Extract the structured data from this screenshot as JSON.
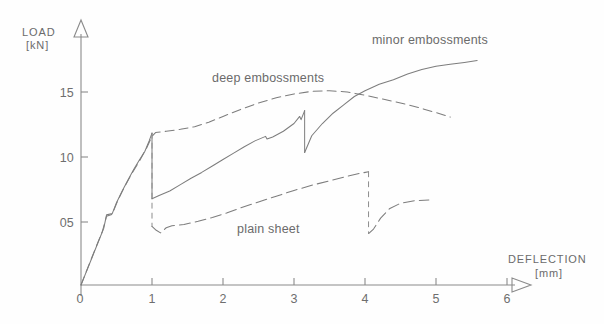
{
  "figure": {
    "background_color": "#fefefe",
    "line_color": "#7d7d7d",
    "axis_color": "#8a8a8a",
    "text_color": "#6b6b6b"
  },
  "axes": {
    "y_title_line1": "LOAD",
    "y_title_line2": "[kN]",
    "x_title_line1": "DEFLECTION",
    "x_title_line2": "[mm]",
    "y_ticks": [
      "15",
      "10",
      "05"
    ],
    "y_origin_label": "0",
    "x_ticks": [
      "1",
      "2",
      "3",
      "4",
      "5",
      "6"
    ]
  },
  "labels": {
    "minor": "minor embossments",
    "deep": "deep embossments",
    "plain": "plain sheet"
  },
  "chart_data": {
    "type": "line",
    "title": "",
    "xlabel": "DEFLECTION [mm]",
    "ylabel": "LOAD [kN]",
    "xlim": [
      0,
      6
    ],
    "ylim": [
      0,
      18.5
    ],
    "xticks": [
      0,
      1,
      2,
      3,
      4,
      5,
      6
    ],
    "yticks": [
      0,
      5,
      10,
      15
    ],
    "ytick_labels": [
      "0",
      "05",
      "10",
      "15"
    ],
    "grid": false,
    "legend_position": "inline-annotations",
    "series": [
      {
        "name": "minor embossments",
        "style": "solid",
        "annotation": "minor embossments",
        "annotation_at": [
          4.7,
          17.9
        ],
        "points": [
          [
            0.0,
            0.0
          ],
          [
            0.08,
            1.1
          ],
          [
            0.16,
            2.2
          ],
          [
            0.24,
            3.3
          ],
          [
            0.32,
            4.4
          ],
          [
            0.36,
            5.45
          ],
          [
            0.44,
            5.55
          ],
          [
            0.5,
            6.4
          ],
          [
            0.58,
            7.3
          ],
          [
            0.66,
            8.15
          ],
          [
            0.74,
            8.95
          ],
          [
            0.82,
            9.7
          ],
          [
            0.9,
            10.4
          ],
          [
            0.96,
            11.2
          ],
          [
            1.0,
            11.8
          ],
          [
            1.0,
            6.7
          ],
          [
            1.1,
            6.95
          ],
          [
            1.25,
            7.3
          ],
          [
            1.4,
            7.8
          ],
          [
            1.55,
            8.3
          ],
          [
            1.7,
            8.75
          ],
          [
            1.85,
            9.25
          ],
          [
            2.0,
            9.75
          ],
          [
            2.15,
            10.25
          ],
          [
            2.3,
            10.75
          ],
          [
            2.45,
            11.2
          ],
          [
            2.6,
            11.55
          ],
          [
            2.62,
            11.35
          ],
          [
            2.7,
            11.5
          ],
          [
            2.85,
            11.95
          ],
          [
            3.0,
            12.55
          ],
          [
            3.08,
            13.1
          ],
          [
            3.1,
            12.85
          ],
          [
            3.15,
            13.55
          ],
          [
            3.15,
            10.3
          ],
          [
            3.25,
            11.6
          ],
          [
            3.4,
            12.55
          ],
          [
            3.55,
            13.35
          ],
          [
            3.7,
            14.0
          ],
          [
            3.85,
            14.65
          ],
          [
            4.0,
            15.1
          ],
          [
            4.2,
            15.6
          ],
          [
            4.4,
            15.95
          ],
          [
            4.6,
            16.4
          ],
          [
            4.8,
            16.75
          ],
          [
            5.0,
            17.0
          ],
          [
            5.2,
            17.15
          ],
          [
            5.4,
            17.3
          ],
          [
            5.58,
            17.45
          ]
        ]
      },
      {
        "name": "deep embossments",
        "style": "dashed",
        "annotation": "deep embossments",
        "annotation_at": [
          2.15,
          16.4
        ],
        "points": [
          [
            0.0,
            0.0
          ],
          [
            0.1,
            1.4
          ],
          [
            0.2,
            2.8
          ],
          [
            0.3,
            4.15
          ],
          [
            0.36,
            5.35
          ],
          [
            0.44,
            5.5
          ],
          [
            0.52,
            6.6
          ],
          [
            0.62,
            7.7
          ],
          [
            0.72,
            8.7
          ],
          [
            0.82,
            9.6
          ],
          [
            0.92,
            10.6
          ],
          [
            1.0,
            11.55
          ],
          [
            1.05,
            11.85
          ],
          [
            1.2,
            11.95
          ],
          [
            1.4,
            12.1
          ],
          [
            1.6,
            12.3
          ],
          [
            1.8,
            12.65
          ],
          [
            2.0,
            13.1
          ],
          [
            2.25,
            13.65
          ],
          [
            2.5,
            14.15
          ],
          [
            2.75,
            14.55
          ],
          [
            3.0,
            14.85
          ],
          [
            3.25,
            15.05
          ],
          [
            3.5,
            15.1
          ],
          [
            3.75,
            15.0
          ],
          [
            4.0,
            14.75
          ],
          [
            4.25,
            14.45
          ],
          [
            4.5,
            14.15
          ],
          [
            4.75,
            13.8
          ],
          [
            5.0,
            13.4
          ],
          [
            5.2,
            13.05
          ]
        ]
      },
      {
        "name": "plain sheet",
        "style": "dash-dot",
        "annotation": "plain sheet",
        "annotation_at": [
          2.35,
          5.15
        ],
        "points": [
          [
            1.0,
            4.55
          ],
          [
            1.06,
            4.25
          ],
          [
            1.12,
            4.05
          ],
          [
            1.2,
            4.45
          ],
          [
            1.28,
            4.6
          ],
          [
            1.45,
            4.7
          ],
          [
            1.65,
            4.95
          ],
          [
            1.85,
            5.25
          ],
          [
            2.05,
            5.6
          ],
          [
            2.25,
            6.0
          ],
          [
            2.5,
            6.45
          ],
          [
            2.75,
            6.9
          ],
          [
            3.0,
            7.35
          ],
          [
            3.25,
            7.75
          ],
          [
            3.5,
            8.1
          ],
          [
            3.75,
            8.45
          ],
          [
            3.95,
            8.7
          ],
          [
            4.05,
            8.8
          ],
          [
            4.05,
            4.0
          ],
          [
            4.12,
            4.35
          ],
          [
            4.22,
            5.2
          ],
          [
            4.35,
            5.95
          ],
          [
            4.5,
            6.35
          ],
          [
            4.7,
            6.55
          ],
          [
            4.9,
            6.6
          ]
        ]
      }
    ],
    "events": [
      {
        "label": "first load drop (shared)",
        "x": 1.0,
        "from": 11.8,
        "to": 6.7
      },
      {
        "label": "plain sheet initial drop",
        "x": 1.0,
        "from": 11.8,
        "to": 4.55
      },
      {
        "label": "minor embossments peak drop",
        "x": 3.15,
        "from": 13.55,
        "to": 10.3
      },
      {
        "label": "plain sheet final drop",
        "x": 4.05,
        "from": 8.8,
        "to": 4.0
      }
    ]
  }
}
